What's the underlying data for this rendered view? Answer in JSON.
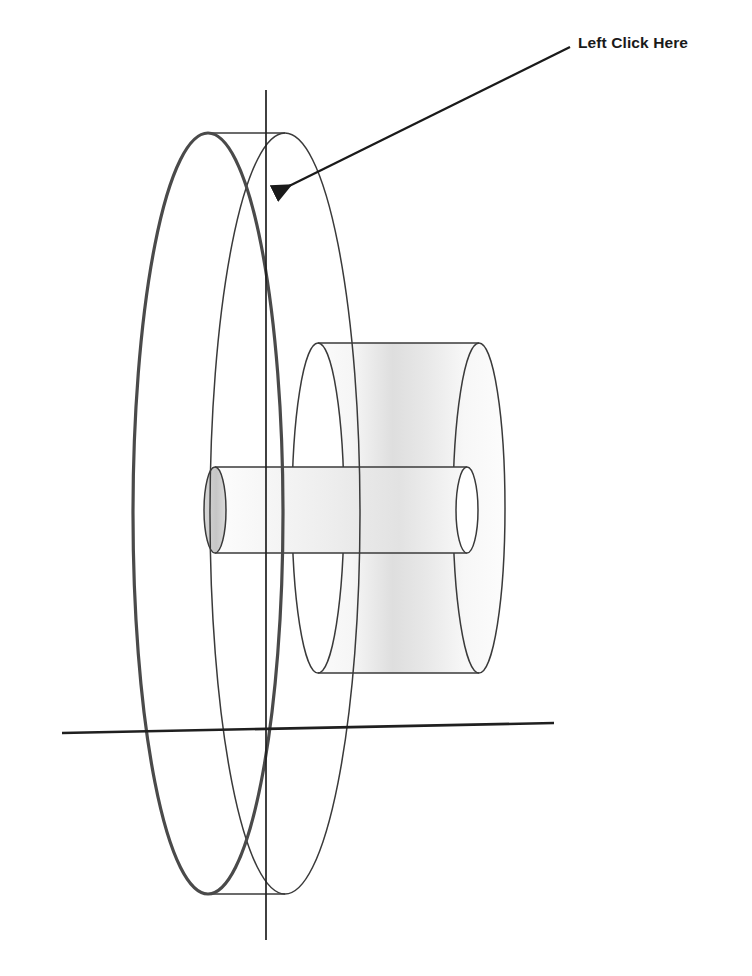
{
  "document": {
    "title": "CAD Wireframe Pulley Assembly",
    "background_color": "#ffffff",
    "width": 752,
    "height": 976
  },
  "annotation": {
    "label": "Left Click Here",
    "label_color": "#1a1a1a",
    "arrow_color": "#1a1a1a",
    "arrow_start_x": 570,
    "arrow_start_y": 47,
    "arrow_tip_x": 268,
    "arrow_tip_y": 197,
    "target_description": "intersection-of-vertical-axis-and-flange-rim"
  },
  "drawing": {
    "line_color": "#3a3a3a",
    "heavy_line_color": "#2b2b2b",
    "axis_color": "#1f1f1f",
    "shade_light": "#f2f2f2",
    "shade_mid": "#dcdcdc",
    "shade_dark": "#c8c8c8",
    "parts": [
      {
        "name": "outer-flange-disc",
        "type": "disc",
        "front_ellipse": {
          "cx": 208,
          "cy": 513,
          "rx": 75,
          "ry": 381
        },
        "back_ellipse": {
          "cx": 285,
          "cy": 513,
          "rx": 75,
          "ry": 381
        },
        "top_tangent_y": 133,
        "bottom_tangent_y": 894
      },
      {
        "name": "hub-cylinder",
        "type": "cylinder",
        "front_ellipse": {
          "cx": 318,
          "cy": 508,
          "rx": 26,
          "ry": 165
        },
        "back_ellipse": {
          "cx": 479,
          "cy": 508,
          "rx": 26,
          "ry": 165
        },
        "top_tangent_y": 343,
        "bottom_tangent_y": 673
      },
      {
        "name": "shaft-cylinder",
        "type": "cylinder",
        "front_ellipse": {
          "cx": 215,
          "cy": 510,
          "rx": 11,
          "ry": 43
        },
        "back_ellipse": {
          "cx": 467,
          "cy": 510,
          "rx": 11,
          "ry": 43
        },
        "top_tangent_y": 467,
        "bottom_tangent_y": 553
      }
    ],
    "axes": [
      {
        "name": "vertical-centerline",
        "x1": 266,
        "y1": 90,
        "x2": 266,
        "y2": 940
      },
      {
        "name": "horizontal-centerline",
        "x1": 62,
        "y1": 733,
        "x2": 554,
        "y2": 723
      }
    ]
  }
}
